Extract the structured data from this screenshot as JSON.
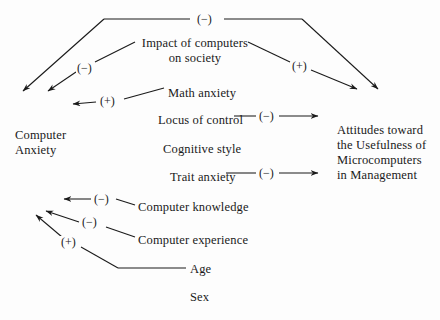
{
  "diagram": {
    "background_color": "#fdfdfd",
    "line_color": "#1a1a1a",
    "nodes": [
      {
        "id": "impact",
        "label": "Impact of computers\non society",
        "x": 140,
        "y": 36,
        "align": "center"
      },
      {
        "id": "math-anxiety",
        "label": "Math anxiety",
        "x": 168,
        "y": 86,
        "align": "left"
      },
      {
        "id": "locus-of-control",
        "label": "Locus of control",
        "x": 158,
        "y": 113,
        "align": "left"
      },
      {
        "id": "cognitive-style",
        "label": "Cognitive style",
        "x": 163,
        "y": 142,
        "align": "left"
      },
      {
        "id": "trait-anxiety",
        "label": "Trait anxiety",
        "x": 170,
        "y": 170,
        "align": "left"
      },
      {
        "id": "computer-knowledge",
        "label": "Computer knowledge",
        "x": 138,
        "y": 200,
        "align": "left"
      },
      {
        "id": "computer-experience",
        "label": "Computer experience",
        "x": 138,
        "y": 233,
        "align": "left"
      },
      {
        "id": "age",
        "label": "Age",
        "x": 190,
        "y": 264,
        "align": "left"
      },
      {
        "id": "sex",
        "label": "Sex",
        "x": 190,
        "y": 291,
        "align": "left"
      },
      {
        "id": "computer-anxiety",
        "label": "Computer\nAnxiety",
        "x": 15,
        "y": 128,
        "align": "left"
      },
      {
        "id": "attitudes",
        "label": "Attitudes toward\nthe Usefulness of\nMicrocomputers\nin Management",
        "x": 337,
        "y": 123,
        "align": "left"
      }
    ],
    "edge_labels": [
      {
        "id": "sign-impact-top",
        "text": "(−)",
        "x": 202,
        "y": 13
      },
      {
        "id": "sign-impact-anxiety",
        "text": "(−)",
        "x": 80,
        "y": 63
      },
      {
        "id": "sign-impact-attitudes",
        "text": "(+)",
        "x": 294,
        "y": 65
      },
      {
        "id": "sign-math-anxiety",
        "text": "(+)",
        "x": 101,
        "y": 97
      },
      {
        "id": "sign-locus",
        "text": "(−)",
        "x": 264,
        "y": 113
      },
      {
        "id": "sign-trait",
        "text": "(−)",
        "x": 264,
        "y": 170
      },
      {
        "id": "sign-knowledge",
        "text": "(−)",
        "x": 96,
        "y": 196
      },
      {
        "id": "sign-experience",
        "text": "(−)",
        "x": 84,
        "y": 221
      },
      {
        "id": "sign-age",
        "text": "(+)",
        "x": 63,
        "y": 241
      }
    ],
    "edges": [
      {
        "id": "edge-top-left-branch",
        "from": "impact-top-bracket",
        "to": "computer-anxiety",
        "sign": "(−)"
      },
      {
        "id": "edge-top-right-branch",
        "from": "impact-top-bracket",
        "to": "attitudes",
        "sign": "(−)"
      },
      {
        "id": "edge-impact-to-anxiety",
        "from": "impact",
        "to": "computer-anxiety",
        "sign": "(−)"
      },
      {
        "id": "edge-impact-to-attitudes",
        "from": "impact",
        "to": "attitudes",
        "sign": "(+)"
      },
      {
        "id": "edge-math-to-anxiety",
        "from": "math-anxiety",
        "to": "computer-anxiety",
        "sign": "(+)"
      },
      {
        "id": "edge-locus-to-attitudes",
        "from": "locus-of-control",
        "to": "attitudes",
        "sign": "(−)"
      },
      {
        "id": "edge-trait-to-attitudes",
        "from": "trait-anxiety",
        "to": "attitudes",
        "sign": "(−)"
      },
      {
        "id": "edge-knowledge-to-anxiety",
        "from": "computer-knowledge",
        "to": "computer-anxiety",
        "sign": "(−)"
      },
      {
        "id": "edge-experience-to-anxiety",
        "from": "computer-experience",
        "to": "computer-anxiety",
        "sign": "(−)"
      },
      {
        "id": "edge-age-to-anxiety",
        "from": "age",
        "to": "computer-anxiety",
        "sign": "(+)"
      }
    ]
  }
}
